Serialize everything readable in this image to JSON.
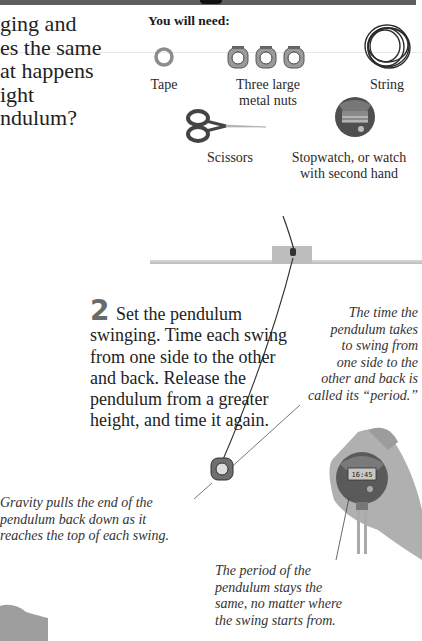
{
  "page": {
    "header_bar_color": "#5e5e5e"
  },
  "intro": {
    "lines": [
      "ging and",
      "es the same",
      "at happens",
      "ight",
      "ndulum?"
    ]
  },
  "materials": {
    "title": "You will need:",
    "items": [
      {
        "name": "tape-icon",
        "label": "Tape"
      },
      {
        "name": "metal-nuts-icon",
        "label_line1": "Three large",
        "label_line2": "metal nuts"
      },
      {
        "name": "string-icon",
        "label": "String"
      },
      {
        "name": "scissors-icon",
        "label": "Scissors"
      },
      {
        "name": "stopwatch-icon",
        "label_line1": "Stopwatch, or watch",
        "label_line2": "with second hand"
      }
    ]
  },
  "step2": {
    "number": "2",
    "text": "Set the pendulum swinging. Time each swing from one side to the other and back. Release the pendulum from a greater height, and time it again."
  },
  "captions": {
    "period_definition": [
      "The time the",
      "pendulum takes",
      "to swing from",
      "one side to the",
      "other and back is",
      "called its “period.”"
    ],
    "gravity": [
      "Gravity pulls the end of the",
      "pendulum back down as it",
      "reaches the top of each swing."
    ],
    "period_constant": [
      "The period of the",
      "pendulum stays the",
      "same, no matter where",
      "the swing starts from."
    ]
  },
  "stopwatch_display": "16:45"
}
